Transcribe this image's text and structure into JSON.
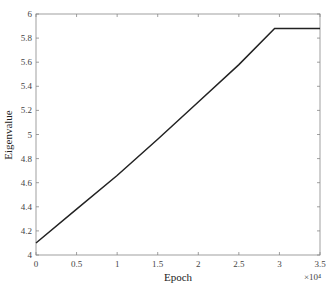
{
  "chart_data": {
    "type": "line",
    "title": "",
    "xlabel": "Epoch",
    "ylabel": "Eigenvalue",
    "x_multiplier": "×10⁴",
    "xlim": [
      0,
      3.5
    ],
    "ylim": [
      4,
      6
    ],
    "xticks": [
      "0",
      "0.5",
      "1",
      "1.5",
      "2",
      "2.5",
      "3",
      "3.5"
    ],
    "yticks": [
      "4",
      "4.2",
      "4.4",
      "4.6",
      "4.8",
      "5",
      "5.2",
      "5.4",
      "5.6",
      "5.8",
      "6"
    ],
    "grid": false,
    "series": [
      {
        "name": "eigenvalue",
        "color": "#222222",
        "x": [
          0,
          0.5,
          1.0,
          1.5,
          2.0,
          2.5,
          2.94,
          3.5
        ],
        "y": [
          4.1,
          4.38,
          4.66,
          4.96,
          5.27,
          5.58,
          5.88,
          5.88
        ]
      }
    ]
  }
}
